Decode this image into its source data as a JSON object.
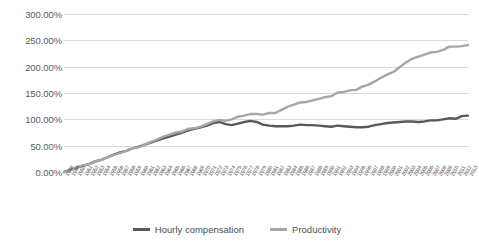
{
  "chart_data": {
    "type": "line",
    "title": "",
    "subtitle": "",
    "xlabel": "",
    "ylabel": "",
    "ylim": [
      0,
      300
    ],
    "ytick_labels": [
      "0.00%",
      "50.00%",
      "100.00%",
      "150.00%",
      "200.00%",
      "250.00%",
      "300.00%"
    ],
    "ytick_values": [
      0,
      50,
      100,
      150,
      200,
      250,
      300
    ],
    "grid": "horizontal",
    "legend_position": "bottom-center",
    "xlim": [
      1948,
      2013
    ],
    "x": [
      1948,
      1949,
      1950,
      1951,
      1952,
      1953,
      1954,
      1955,
      1956,
      1957,
      1958,
      1959,
      1960,
      1961,
      1962,
      1963,
      1964,
      1965,
      1966,
      1967,
      1968,
      1969,
      1970,
      1971,
      1972,
      1973,
      1974,
      1975,
      1976,
      1977,
      1978,
      1979,
      1980,
      1981,
      1982,
      1983,
      1984,
      1985,
      1986,
      1987,
      1988,
      1989,
      1990,
      1991,
      1992,
      1993,
      1994,
      1995,
      1996,
      1997,
      1998,
      1999,
      2000,
      2001,
      2002,
      2003,
      2004,
      2005,
      2006,
      2007,
      2008,
      2009,
      2010,
      2011,
      2012,
      2013
    ],
    "categories": [
      "1948",
      "1949",
      "1950",
      "1951",
      "1952",
      "1953",
      "1954",
      "1955",
      "1956",
      "1957",
      "1958",
      "1959",
      "1960",
      "1961",
      "1962",
      "1963",
      "1964",
      "1965",
      "1966",
      "1967",
      "1968",
      "1969",
      "1970",
      "1971",
      "1972",
      "1973",
      "1974",
      "1975",
      "1976",
      "1977",
      "1978",
      "1979",
      "1980",
      "1981",
      "1982",
      "1983",
      "1984",
      "1985",
      "1986",
      "1987",
      "1988",
      "1989",
      "1990",
      "1991",
      "1992",
      "1993",
      "1994",
      "1995",
      "1996",
      "1997",
      "1998",
      "1999",
      "2000",
      "2001",
      "2002",
      "2003",
      "2004",
      "2005",
      "2006",
      "2007",
      "2008",
      "2009",
      "2010",
      "2011",
      "2012",
      "2013"
    ],
    "series": [
      {
        "name": "Hourly compensation",
        "color": "#595959",
        "values": [
          0,
          4,
          8,
          12,
          15,
          20,
          23,
          28,
          33,
          37,
          40,
          45,
          48,
          52,
          56,
          60,
          64,
          67,
          71,
          75,
          79,
          82,
          85,
          88,
          93,
          95,
          91,
          89,
          92,
          95,
          97,
          95,
          90,
          88,
          87,
          87,
          87,
          88,
          90,
          89,
          89,
          88,
          87,
          86,
          88,
          87,
          86,
          85,
          85,
          86,
          89,
          91,
          93,
          94,
          95,
          96,
          96,
          95,
          96,
          98,
          98,
          100,
          102,
          101,
          106,
          107
        ]
      },
      {
        "name": "Productivity",
        "color": "#a6a6a6",
        "values": [
          0,
          3,
          9,
          12,
          15,
          20,
          23,
          28,
          32,
          36,
          40,
          45,
          47,
          52,
          57,
          62,
          67,
          71,
          75,
          77,
          82,
          83,
          86,
          91,
          96,
          99,
          97,
          100,
          105,
          107,
          110,
          110,
          109,
          112,
          112,
          118,
          124,
          128,
          132,
          133,
          136,
          139,
          142,
          144,
          151,
          152,
          155,
          156,
          162,
          166,
          172,
          179,
          185,
          190,
          199,
          208,
          215,
          219,
          223,
          227,
          228,
          232,
          238,
          238,
          239,
          241
        ]
      }
    ]
  },
  "legend": {
    "items": [
      {
        "label": "Hourly compensation",
        "color": "#595959"
      },
      {
        "label": "Productivity",
        "color": "#a6a6a6"
      }
    ]
  }
}
